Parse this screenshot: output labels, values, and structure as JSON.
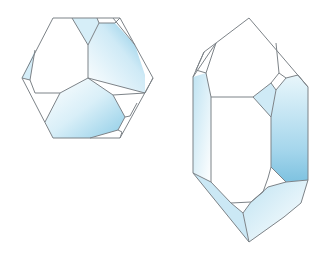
{
  "figure": {
    "crystals": [
      {
        "name": "hexagonal-view"
      },
      {
        "name": "prismatic-view"
      }
    ],
    "colors": {
      "edge": "#7d8388",
      "tint_light": "#e6f5fb",
      "tint_mid": "#bfe3f2",
      "tint_dark": "#8ccbe6",
      "background": "#ffffff"
    }
  }
}
